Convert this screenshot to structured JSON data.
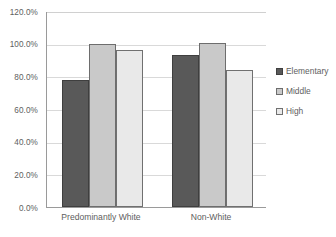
{
  "chart_data": {
    "type": "bar",
    "title": "",
    "subtitle": "",
    "xlabel": "",
    "ylabel": "",
    "categories": [
      "Predominantly White",
      "Non-White"
    ],
    "series": [
      {
        "name": "Elementary",
        "values": [
          78.0,
          93.0
        ],
        "color": "#595959"
      },
      {
        "name": "Middle",
        "values": [
          100.0,
          100.7
        ],
        "color": "#c9c9c9"
      },
      {
        "name": "High",
        "values": [
          96.3,
          84.0
        ],
        "color": "#e9e9e9"
      }
    ],
    "ylim": [
      0,
      120
    ],
    "ytick_values": [
      0,
      20,
      40,
      60,
      80,
      100,
      120
    ],
    "ytick_labels": [
      "0.0%",
      "20.0%",
      "40.0%",
      "60.0%",
      "80.0%",
      "100.0%",
      "120.0%"
    ],
    "grid": "horizontal",
    "legend_position": "right",
    "legend_entries": [
      "Elementary",
      "Middle",
      "High"
    ]
  }
}
